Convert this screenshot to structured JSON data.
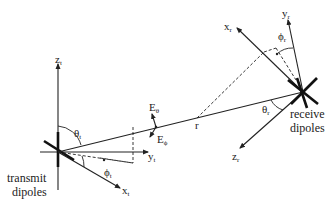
{
  "diagram": {
    "transmit": {
      "label_line1": "transmit",
      "label_line2": "dipoles",
      "axes": {
        "z": "z",
        "y": "y",
        "x": "x",
        "sub": "t"
      },
      "angles": {
        "theta": "θ",
        "phi": "ϕ",
        "sub": "t"
      }
    },
    "receive": {
      "label_line1": "receive",
      "label_line2": "dipoles",
      "axes": {
        "z": "z",
        "y": "y",
        "x": "x",
        "sub": "r"
      },
      "angles": {
        "theta": "θ",
        "phi": "ϕ",
        "sub": "r"
      }
    },
    "link": {
      "distance_label": "r"
    },
    "field": {
      "e_theta": "E",
      "e_theta_sub": "θ",
      "e_phi": "E",
      "e_phi_sub": "ϕ"
    },
    "colors": {
      "ink": "#222222",
      "background": "#ffffff"
    }
  }
}
